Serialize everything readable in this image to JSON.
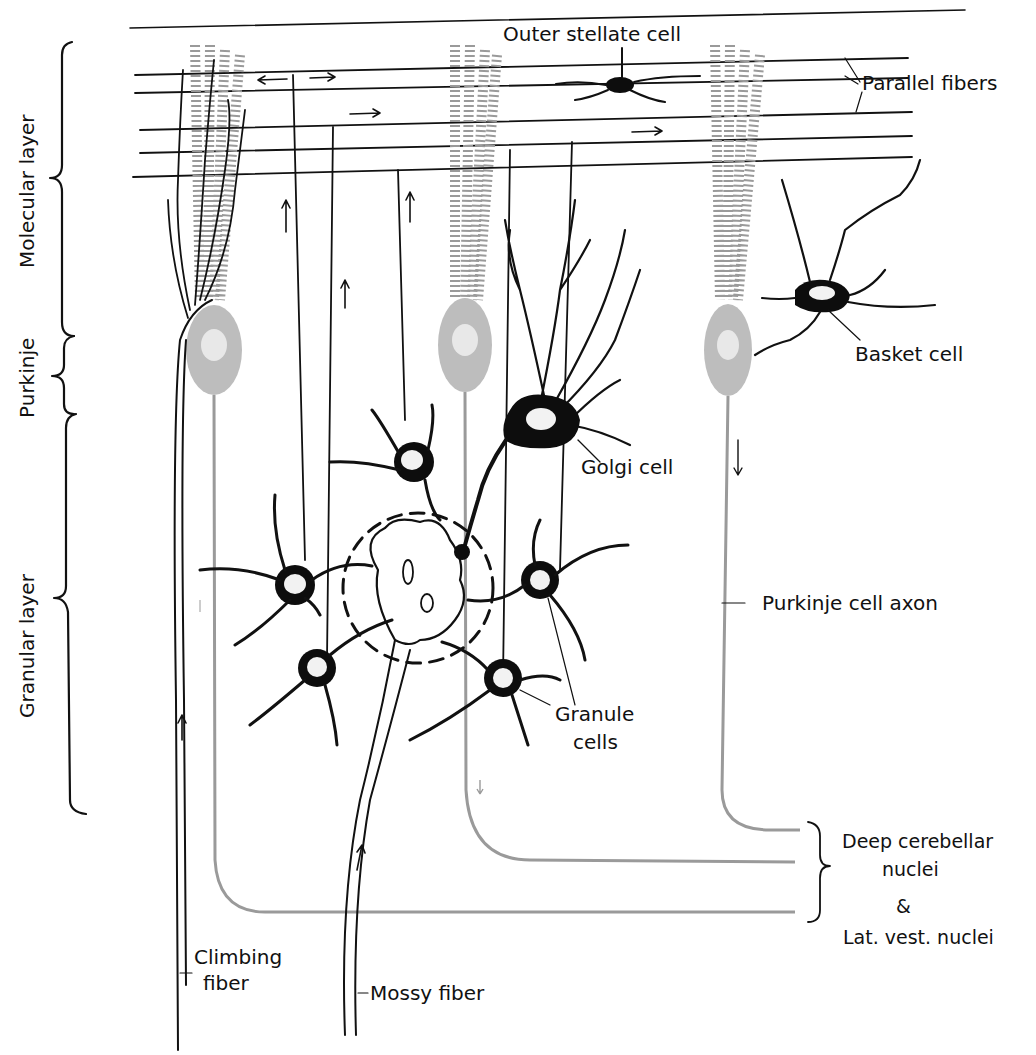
{
  "diagram": {
    "layers": [
      {
        "label": "Molecular layer"
      },
      {
        "label": "Purkinje"
      },
      {
        "label": "Granular layer"
      }
    ],
    "labels": {
      "outer_stellate": "Outer stellate cell",
      "parallel_fibers": "Parallel fibers",
      "basket_cell": "Basket cell",
      "golgi_cell": "Golgi cell",
      "purkinje_axon": "Purkinje cell axon",
      "granule_cells_1": "Granule",
      "granule_cells_2": "cells",
      "deep_nuclei_1": "Deep cerebellar",
      "deep_nuclei_2": "nuclei",
      "ampersand": "&",
      "lat_vest": "Lat. vest. nuclei",
      "climbing_1": "Climbing",
      "climbing_2": "fiber",
      "mossy_fiber": "Mossy fiber"
    },
    "colors": {
      "ink": "#111111",
      "purkinje_fill": "#bdbdbd",
      "background": "#ffffff"
    }
  }
}
